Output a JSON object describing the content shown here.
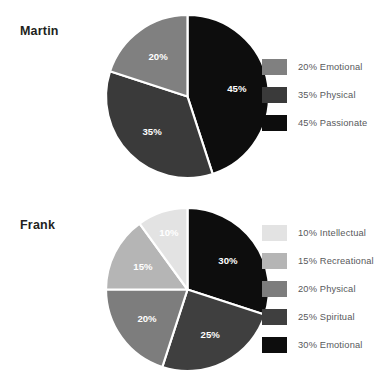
{
  "page": {
    "background": "#ffffff",
    "width": 389,
    "height": 386
  },
  "chart_data": [
    {
      "type": "pie",
      "title": "Martin",
      "xlabel": "",
      "ylabel": "",
      "start_angle_deg": 0,
      "direction": "clockwise",
      "legend_position": "right",
      "grid": false,
      "categories": [
        "Passionate",
        "Physical",
        "Emotional"
      ],
      "values": [
        45,
        35,
        20
      ],
      "slice_labels": [
        "45%",
        "35%",
        "20%"
      ],
      "colors": [
        "#0d0d0d",
        "#3a3a3a",
        "#808080"
      ],
      "legend": [
        {
          "label": "20% Emotional",
          "color": "#808080",
          "percent": 20,
          "name": "Emotional"
        },
        {
          "label": "35% Physical",
          "color": "#3a3a3a",
          "percent": 35,
          "name": "Physical"
        },
        {
          "label": "45% Passionate",
          "color": "#0d0d0d",
          "percent": 45,
          "name": "Passionate"
        }
      ]
    },
    {
      "type": "pie",
      "title": "Frank",
      "xlabel": "",
      "ylabel": "",
      "start_angle_deg": 0,
      "direction": "clockwise",
      "legend_position": "right",
      "grid": false,
      "categories": [
        "Emotional",
        "Spiritual",
        "Physical",
        "Recreational",
        "Intellectual"
      ],
      "values": [
        30,
        25,
        20,
        15,
        10
      ],
      "slice_labels": [
        "30%",
        "25%",
        "20%",
        "15%",
        "10%"
      ],
      "colors": [
        "#0d0d0d",
        "#3f3f3f",
        "#7d7d7d",
        "#b5b5b5",
        "#e3e3e3"
      ],
      "legend": [
        {
          "label": "10% Intellectual",
          "color": "#e3e3e3",
          "percent": 10,
          "name": "Intellectual"
        },
        {
          "label": "15% Recreational",
          "color": "#b5b5b5",
          "percent": 15,
          "name": "Recreational"
        },
        {
          "label": "20% Physical",
          "color": "#7d7d7d",
          "percent": 20,
          "name": "Physical"
        },
        {
          "label": "25% Spiritual",
          "color": "#3f3f3f",
          "percent": 25,
          "name": "Spiritual"
        },
        {
          "label": "30% Emotional",
          "color": "#0d0d0d",
          "percent": 30,
          "name": "Emotional"
        }
      ]
    }
  ]
}
